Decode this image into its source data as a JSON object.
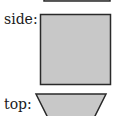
{
  "views": [
    {
      "label": "side:",
      "shape": "square"
    },
    {
      "label": "top:",
      "shape": "trapezoid"
    }
  ],
  "colors": {
    "fill": "#c8c8c8",
    "stroke": "#2a2a2a"
  }
}
